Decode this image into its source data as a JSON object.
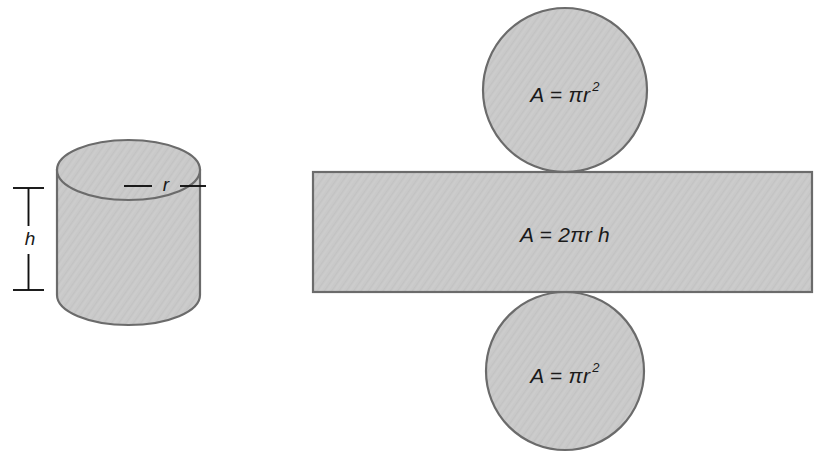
{
  "figure": {
    "background_color": "#ffffff",
    "fill_color": "#c9c9c9",
    "stroke_color": "#6b6b6b",
    "text_color": "#1a1a1a"
  },
  "cylinder": {
    "name": "cylinder-solid",
    "radius_label": "r",
    "height_label": "h",
    "center_x": 128,
    "left_x": 57,
    "right_x": 200,
    "top_ellipse_cy": 170,
    "ellipse_ry": 30,
    "body_bottom_y": 325,
    "radius_leader_y": 186,
    "height_bracket_x": 28,
    "height_bracket_top_y": 188,
    "height_bracket_bottom_y": 290
  },
  "net": {
    "rectangle": {
      "name": "lateral-surface-rectangle",
      "formula": "A = 2",
      "formula_pi": "π",
      "formula_tail": "r h",
      "x": 313,
      "y": 172,
      "width": 499,
      "height": 120,
      "label_x": 565,
      "label_y": 236
    },
    "top_circle": {
      "name": "top-cap-circle",
      "formula": "A = ",
      "formula_pi": "π",
      "formula_var": "r",
      "formula_exponent": "2",
      "cx": 565,
      "cy": 90,
      "r": 82,
      "label_x": 565,
      "label_y": 96
    },
    "bottom_circle": {
      "name": "bottom-cap-circle",
      "formula": "A = ",
      "formula_pi": "π",
      "formula_var": "r",
      "formula_exponent": "2",
      "cx": 565,
      "cy": 371,
      "r": 79,
      "label_x": 565,
      "label_y": 377
    }
  }
}
